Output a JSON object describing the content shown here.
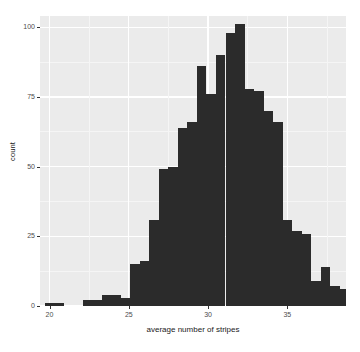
{
  "chart_data": {
    "type": "bar",
    "subtype": "histogram",
    "title": "",
    "subtitle": "",
    "xlabel": "average number of stripes",
    "ylabel": "count",
    "grid": true,
    "legend": null,
    "xlim": [
      19.4,
      38.7
    ],
    "ylim": [
      0,
      104
    ],
    "xticks": [
      20,
      25,
      30,
      35
    ],
    "xticklabels": [
      "20",
      "25",
      "30",
      "35"
    ],
    "yticks": [
      0,
      25,
      50,
      75,
      100
    ],
    "yticklabels": [
      "0",
      "25",
      "50",
      "75",
      "100"
    ],
    "bin_width": 0.6,
    "bar_color": "#2b2b2b",
    "panel_color": "#ebebeb",
    "grid_color": "#ffffff",
    "bins": [
      {
        "x": 20.0,
        "count": 1
      },
      {
        "x": 20.6,
        "count": 1
      },
      {
        "x": 21.2,
        "count": 0
      },
      {
        "x": 21.8,
        "count": 0
      },
      {
        "x": 22.4,
        "count": 2
      },
      {
        "x": 23.0,
        "count": 2
      },
      {
        "x": 23.6,
        "count": 4
      },
      {
        "x": 24.2,
        "count": 4
      },
      {
        "x": 24.8,
        "count": 3
      },
      {
        "x": 25.4,
        "count": 15
      },
      {
        "x": 26.0,
        "count": 16
      },
      {
        "x": 26.6,
        "count": 31
      },
      {
        "x": 27.2,
        "count": 49
      },
      {
        "x": 27.8,
        "count": 50
      },
      {
        "x": 28.4,
        "count": 64
      },
      {
        "x": 29.0,
        "count": 66
      },
      {
        "x": 29.6,
        "count": 86
      },
      {
        "x": 30.2,
        "count": 76
      },
      {
        "x": 30.8,
        "count": 90
      },
      {
        "x": 31.4,
        "count": 98
      },
      {
        "x": 32.0,
        "count": 101
      },
      {
        "x": 32.6,
        "count": 78
      },
      {
        "x": 33.2,
        "count": 77
      },
      {
        "x": 33.8,
        "count": 70
      },
      {
        "x": 34.4,
        "count": 66
      },
      {
        "x": 35.0,
        "count": 31
      },
      {
        "x": 35.6,
        "count": 27
      },
      {
        "x": 36.2,
        "count": 26
      },
      {
        "x": 36.8,
        "count": 9
      },
      {
        "x": 37.4,
        "count": 14
      },
      {
        "x": 38.0,
        "count": 7
      },
      {
        "x": 38.6,
        "count": 6
      },
      {
        "x": 39.2,
        "count": 3
      },
      {
        "x": 39.8,
        "count": 3
      },
      {
        "x": 40.4,
        "count": 1
      }
    ]
  },
  "axes": {
    "y_title": "count",
    "x_title": "average number of stripes"
  }
}
